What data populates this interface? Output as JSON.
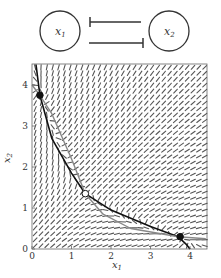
{
  "network": {
    "node1": {
      "label": "x",
      "sub": "1"
    },
    "node2": {
      "label": "x",
      "sub": "2"
    },
    "edges": [
      "x2 represses x1",
      "x1 represses x2"
    ]
  },
  "plot": {
    "xlabel": "x",
    "xlabel_sub": "1",
    "ylabel": "x",
    "ylabel_sub": "2",
    "xticks": [
      "0",
      "1",
      "2",
      "3",
      "4"
    ],
    "yticks": [
      "0",
      "1",
      "2",
      "3",
      "4"
    ],
    "xlim": [
      0,
      4.4
    ],
    "ylim": [
      0,
      4.5
    ]
  },
  "chart_data": {
    "type": "scatter",
    "title": "",
    "xlabel": "x1",
    "ylabel": "x2",
    "xlim": [
      0,
      4.4
    ],
    "ylim": [
      0,
      4.5
    ],
    "background": "vector field (direction arrows)",
    "nullclines": [
      {
        "name": "x1-nullcline",
        "color": "#111111",
        "points": [
          [
            0.1,
            4.5
          ],
          [
            0.2,
            3.75
          ],
          [
            0.5,
            2.7
          ],
          [
            1.0,
            1.85
          ],
          [
            1.35,
            1.35
          ],
          [
            2.0,
            0.95
          ],
          [
            3.0,
            0.55
          ],
          [
            3.7,
            0.3
          ],
          [
            3.9,
            0.12
          ],
          [
            4.0,
            0.0
          ]
        ]
      },
      {
        "name": "x2-nullcline",
        "color": "#888888",
        "points": [
          [
            0.0,
            4.0
          ],
          [
            0.2,
            3.75
          ],
          [
            0.5,
            3.3
          ],
          [
            1.0,
            2.2
          ],
          [
            1.35,
            1.35
          ],
          [
            1.8,
            0.85
          ],
          [
            2.5,
            0.5
          ],
          [
            3.7,
            0.3
          ],
          [
            4.4,
            0.25
          ]
        ]
      }
    ],
    "fixed_points": [
      {
        "x": 0.2,
        "y": 3.75,
        "type": "stable"
      },
      {
        "x": 1.35,
        "y": 1.35,
        "type": "unstable"
      },
      {
        "x": 3.75,
        "y": 0.3,
        "type": "stable"
      }
    ]
  }
}
